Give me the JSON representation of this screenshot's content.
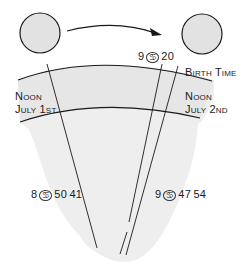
{
  "diagram": {
    "title": "",
    "bodies": [
      {
        "id": "sun-noon-july-1",
        "shape": "circle",
        "fill": "#e2e2e2"
      },
      {
        "id": "sun-birth-time",
        "shape": "circle",
        "fill": "#e2e2e2"
      }
    ],
    "arrow": {
      "direction": "left-to-right",
      "meaning": "sun motion"
    },
    "labels": {
      "birth_position": {
        "degree": "9",
        "sign_glyph": "♋",
        "minutes": "20"
      },
      "birth_time": "Birth Time",
      "noon_left_line1": "Noon",
      "noon_left_line2": "July 1st",
      "noon_right_line1": "Noon",
      "noon_right_line2": "July 2nd",
      "position_july1": {
        "degree": "8",
        "sign_glyph": "♋",
        "minutes": "50",
        "seconds": "41"
      },
      "position_july2": {
        "degree": "9",
        "sign_glyph": "♋",
        "minutes": "47",
        "seconds": "54"
      }
    },
    "colors": {
      "ink": "#1a1a1a",
      "paper": "#ececec",
      "band": "#e4e4e4",
      "circle_fill": "#e2e2e2"
    }
  }
}
